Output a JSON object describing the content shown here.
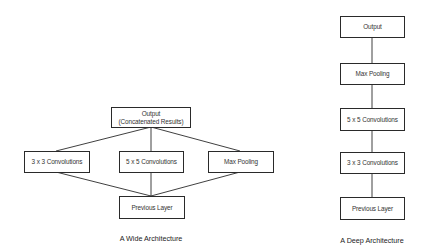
{
  "wide": {
    "caption": "A Wide Architecture",
    "output_line1": "Output",
    "output_line2": "(Concatenated Results)",
    "branch1": "3 x 3 Convolutions",
    "branch2": "5 x 5 Convolutions",
    "branch3": "Max Pooling",
    "input": "Previous Layer"
  },
  "deep": {
    "caption": "A Deep Architecture",
    "layers": [
      "Output",
      "Max Pooling",
      "5 x 5 Convolutions",
      "3 x 3 Convolutions",
      "Previous Layer"
    ]
  },
  "colors": {
    "line": "#2a2a2a",
    "text": "#333333",
    "background": "#ffffff"
  }
}
